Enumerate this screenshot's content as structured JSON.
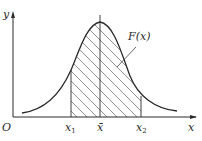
{
  "diagram": {
    "type": "normal-distribution-curve",
    "axes": {
      "x_label": "x",
      "y_label": "y",
      "origin_label": "O"
    },
    "curve_label": "F(x)",
    "markers": [
      {
        "id": "x1",
        "base": "x",
        "sub": "1"
      },
      {
        "id": "xbar",
        "base": "x̄",
        "sub": ""
      },
      {
        "id": "x2",
        "base": "x",
        "sub": "2"
      }
    ],
    "shaded_region": {
      "from": "x1",
      "to": "x2",
      "pattern": "diagonal-hatch"
    },
    "colors": {
      "line": "#2a2a2a",
      "background": "#ffffff"
    }
  }
}
